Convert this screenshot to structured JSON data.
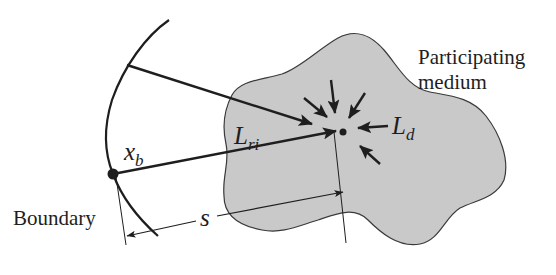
{
  "diagram": {
    "type": "radiative-transfer-schematic",
    "labels": {
      "medium_line1": "Participating",
      "medium_line2": "medium",
      "boundary": "Boundary",
      "boundary_point_main": "x",
      "boundary_point_sub": "b",
      "ray_radiance_main": "L",
      "ray_radiance_sub": "ri",
      "diffuse_radiance_main": "L",
      "diffuse_radiance_sub": "d",
      "distance": "s"
    },
    "colors": {
      "medium_fill": "#c9c9c9",
      "stroke": "#1e1e1e",
      "background": "#ffffff"
    },
    "elements": [
      "participating-medium-blob",
      "boundary-curve",
      "boundary-point",
      "upper-ray-arrow",
      "incident-ray-arrow",
      "scattered-in-arrows",
      "evaluation-point",
      "distance-dimension-s"
    ]
  }
}
